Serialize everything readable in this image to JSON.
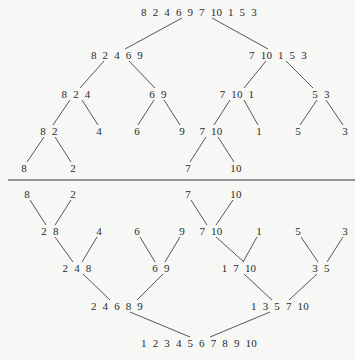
{
  "split_phase": {
    "nodes": [
      {
        "id": "s0",
        "label": "8  2  4  6  9  7  10  1  5  3",
        "x": 199,
        "y": 12
      },
      {
        "id": "s1a",
        "label": "8  2  4  6  9",
        "x": 117,
        "y": 55
      },
      {
        "id": "s1b",
        "label": "7  10  1  5  3",
        "x": 278,
        "y": 55
      },
      {
        "id": "s2a",
        "label": "8  2  4",
        "x": 76,
        "y": 94
      },
      {
        "id": "s2b",
        "label": "6  9",
        "x": 158,
        "y": 94
      },
      {
        "id": "s2c",
        "label": "7  10  1",
        "x": 237,
        "y": 94
      },
      {
        "id": "s2d",
        "label": "5  3",
        "x": 321,
        "y": 94
      },
      {
        "id": "s3a",
        "label": "8  2",
        "x": 49,
        "y": 131
      },
      {
        "id": "s3b",
        "label": "4",
        "x": 99,
        "y": 131
      },
      {
        "id": "s3c",
        "label": "6",
        "x": 137,
        "y": 131
      },
      {
        "id": "s3d",
        "label": "9",
        "x": 182,
        "y": 131
      },
      {
        "id": "s3e",
        "label": "7  10",
        "x": 211,
        "y": 131
      },
      {
        "id": "s3f",
        "label": "1",
        "x": 259,
        "y": 131
      },
      {
        "id": "s3g",
        "label": "5",
        "x": 298,
        "y": 131
      },
      {
        "id": "s3h",
        "label": "3",
        "x": 345,
        "y": 131
      },
      {
        "id": "s4a",
        "label": "8",
        "x": 24,
        "y": 168
      },
      {
        "id": "s4b",
        "label": "2",
        "x": 73,
        "y": 168
      },
      {
        "id": "s4c",
        "label": "7",
        "x": 188,
        "y": 168
      },
      {
        "id": "s4d",
        "label": "10",
        "x": 236,
        "y": 168
      }
    ],
    "edges": [
      [
        182,
        18,
        125,
        49
      ],
      [
        212,
        18,
        268,
        49
      ],
      [
        104,
        61,
        80,
        88
      ],
      [
        129,
        61,
        155,
        88
      ],
      [
        266,
        61,
        244,
        88
      ],
      [
        286,
        61,
        313,
        88
      ],
      [
        70,
        100,
        53,
        125
      ],
      [
        82,
        100,
        98,
        125
      ],
      [
        154,
        100,
        138,
        125
      ],
      [
        164,
        100,
        180,
        125
      ],
      [
        230,
        100,
        214,
        125
      ],
      [
        244,
        100,
        258,
        125
      ],
      [
        317,
        100,
        300,
        125
      ],
      [
        326,
        100,
        343,
        125
      ],
      [
        44,
        137,
        27,
        162
      ],
      [
        55,
        137,
        71,
        162
      ],
      [
        206,
        137,
        190,
        162
      ],
      [
        218,
        137,
        234,
        162
      ]
    ]
  },
  "separator": {
    "y": 180
  },
  "merge_phase": {
    "nodes": [
      {
        "id": "m0a",
        "label": "8",
        "x": 27,
        "y": 194
      },
      {
        "id": "m0b",
        "label": "2",
        "x": 73,
        "y": 194
      },
      {
        "id": "m0c",
        "label": "7",
        "x": 188,
        "y": 194
      },
      {
        "id": "m0d",
        "label": "10",
        "x": 236,
        "y": 194
      },
      {
        "id": "m1a",
        "label": "2  8",
        "x": 50,
        "y": 231
      },
      {
        "id": "m1b",
        "label": "4",
        "x": 99,
        "y": 231
      },
      {
        "id": "m1c",
        "label": "6",
        "x": 137,
        "y": 231
      },
      {
        "id": "m1d",
        "label": "9",
        "x": 182,
        "y": 231
      },
      {
        "id": "m1e",
        "label": "7  10",
        "x": 211,
        "y": 231
      },
      {
        "id": "m1f",
        "label": "1",
        "x": 259,
        "y": 231
      },
      {
        "id": "m1g",
        "label": "5",
        "x": 298,
        "y": 231
      },
      {
        "id": "m1h",
        "label": "3",
        "x": 345,
        "y": 231
      },
      {
        "id": "m2a",
        "label": "2  4  8",
        "x": 77,
        "y": 268
      },
      {
        "id": "m2b",
        "label": "6  9",
        "x": 161,
        "y": 268
      },
      {
        "id": "m2c",
        "label": "1  7  10",
        "x": 239,
        "y": 268
      },
      {
        "id": "m2d",
        "label": "3  5",
        "x": 321,
        "y": 268
      },
      {
        "id": "m3a",
        "label": "2  4  6  8  9",
        "x": 117,
        "y": 306
      },
      {
        "id": "m3b",
        "label": "1  3  5  7  10",
        "x": 280,
        "y": 306
      },
      {
        "id": "m4",
        "label": "1  2  3  4  5  6  7  8  9  10",
        "x": 199,
        "y": 343
      }
    ],
    "edges": [
      [
        30,
        200,
        46,
        225
      ],
      [
        71,
        200,
        55,
        225
      ],
      [
        191,
        200,
        207,
        225
      ],
      [
        233,
        200,
        216,
        225
      ],
      [
        55,
        237,
        73,
        262
      ],
      [
        97,
        237,
        82,
        262
      ],
      [
        140,
        237,
        155,
        262
      ],
      [
        180,
        237,
        165,
        262
      ],
      [
        216,
        237,
        244,
        262
      ],
      [
        257,
        237,
        243,
        262
      ],
      [
        301,
        237,
        318,
        262
      ],
      [
        343,
        237,
        327,
        262
      ],
      [
        83,
        274,
        110,
        300
      ],
      [
        163,
        274,
        137,
        300
      ],
      [
        244,
        274,
        272,
        300
      ],
      [
        317,
        274,
        289,
        300
      ],
      [
        130,
        312,
        190,
        337
      ],
      [
        270,
        312,
        210,
        337
      ]
    ]
  }
}
